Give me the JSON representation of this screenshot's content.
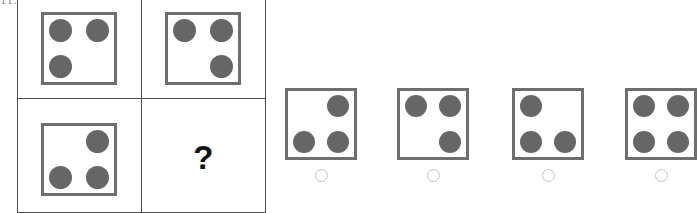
{
  "problem": {
    "number_label": "11.",
    "question_symbol": "?"
  },
  "matrix": {
    "rows": 2,
    "cols": 2,
    "cells": [
      {
        "id": "cell-r0c0",
        "type": "dice",
        "dots": [
          "top-left",
          "top-right",
          "bottom-left"
        ],
        "dot_count": 3
      },
      {
        "id": "cell-r0c1",
        "type": "dice",
        "dots": [
          "top-left",
          "top-right",
          "bottom-right"
        ],
        "dot_count": 3
      },
      {
        "id": "cell-r1c0",
        "type": "dice",
        "dots": [
          "top-right",
          "bottom-left",
          "bottom-right"
        ],
        "dot_count": 3
      },
      {
        "id": "cell-r1c1",
        "type": "question",
        "dots": [],
        "dot_count": 0
      }
    ]
  },
  "options": [
    {
      "id": "option-1",
      "dots": [
        "top-right",
        "bottom-left",
        "bottom-right"
      ],
      "dot_count": 3,
      "selected": false
    },
    {
      "id": "option-2",
      "dots": [
        "top-left",
        "top-right",
        "bottom-right"
      ],
      "dot_count": 3,
      "selected": false
    },
    {
      "id": "option-3",
      "dots": [
        "top-left",
        "bottom-left",
        "bottom-right"
      ],
      "dot_count": 3,
      "selected": false
    },
    {
      "id": "option-4",
      "dots": [
        "top-left",
        "top-right",
        "bottom-left",
        "bottom-right"
      ],
      "dot_count": 4,
      "selected": false
    }
  ],
  "colors": {
    "dot_fill": "#666666",
    "dice_border": "#6e6e6e",
    "matrix_line": "#4d4d4d",
    "radio_border": "#c3c3c3",
    "background": "#ffffff",
    "question_mark": "#111111",
    "problem_number": "#8d8d8d"
  }
}
